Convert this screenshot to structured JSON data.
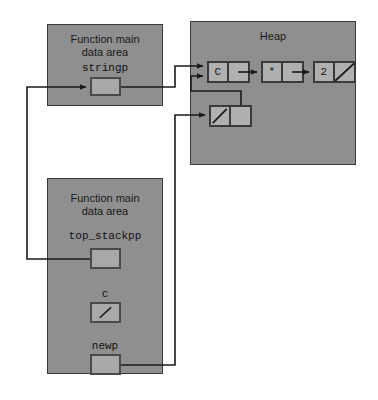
{
  "diagram": {
    "colors": {
      "panel_fill": "#8f8f8f",
      "panel_border": "#3a3a3a",
      "box_fill": "#a8a8a8",
      "box_border": "#4a4a4a",
      "cell_fill": "#b0b0b0",
      "cell_border": "#3a3a3a",
      "line": "#1a1a1a",
      "background": "#ffffff",
      "text": "#111111"
    }
  },
  "regions": {
    "top_frame": {
      "title": "Function main\ndata area",
      "variables": [
        {
          "name": "stringp",
          "value": ""
        }
      ]
    },
    "heap": {
      "title": "Heap"
    },
    "bottom_frame": {
      "title": "Function main\ndata area",
      "variables": [
        {
          "name": "top_stackpp",
          "value": ""
        },
        {
          "name": "c",
          "value": "/"
        },
        {
          "name": "newp",
          "value": ""
        }
      ]
    }
  },
  "heap_nodes": [
    {
      "id": "node-c",
      "data": "C",
      "next": "pointer"
    },
    {
      "id": "node-star",
      "data": "*",
      "next": "pointer"
    },
    {
      "id": "node-two",
      "data": "2",
      "next": "null"
    },
    {
      "id": "node-new",
      "data": "/",
      "next": "pointer"
    }
  ]
}
